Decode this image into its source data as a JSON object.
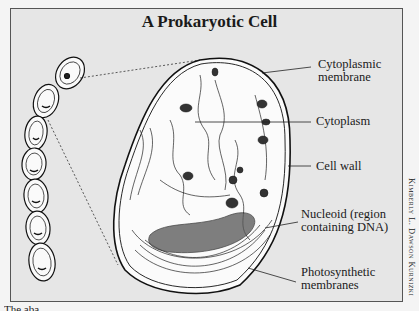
{
  "diagram": {
    "title": "A Prokaryotic Cell",
    "labels": [
      {
        "id": "cytoplasmic-membrane",
        "line1": "Cytoplasmic",
        "line2": "membrane"
      },
      {
        "id": "cytoplasm",
        "line1": "Cytoplasm",
        "line2": ""
      },
      {
        "id": "cell-wall",
        "line1": "Cell wall",
        "line2": ""
      },
      {
        "id": "nucleoid",
        "line1": "Nucleoid (region",
        "line2": "containing DNA)"
      },
      {
        "id": "photosynthetic-membranes",
        "line1": "Photosynthetic",
        "line2": "membranes"
      }
    ],
    "credit": "Kimberly L. Dawson Kurnizki",
    "caption_partial": "The aba...",
    "chain_cell_count": 7,
    "colors": {
      "background": "#e6e6e6",
      "ink": "#1a1a1a",
      "frame": "#555555"
    }
  }
}
